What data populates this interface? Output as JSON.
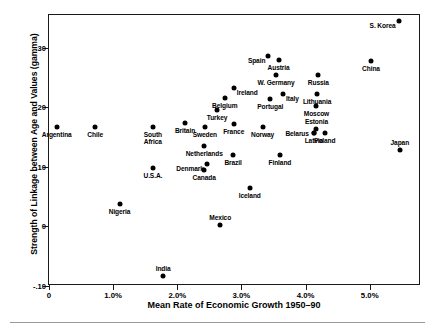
{
  "chart_data": {
    "type": "scatter",
    "title": "",
    "xlabel": "Mean Rate of Economic Growth 1950–90",
    "ylabel": "Strength of Linkage between Age and Values (gamma)",
    "xlim": [
      0,
      5.8
    ],
    "ylim": [
      -0.1,
      0.355
    ],
    "grid": false,
    "legend": "none",
    "xticks": [
      {
        "value": 0,
        "label": "0"
      },
      {
        "value": 1.0,
        "label": "1.0%"
      },
      {
        "value": 2.0,
        "label": "2.0%"
      },
      {
        "value": 3.0,
        "label": "3.0%"
      },
      {
        "value": 4.0,
        "label": "4.0%"
      },
      {
        "value": 5.0,
        "label": "5.0%"
      }
    ],
    "yticks": [
      {
        "value": 0.3,
        "label": ".30"
      },
      {
        "value": 0.2,
        "label": ".20"
      },
      {
        "value": 0.1,
        "label": ".10"
      },
      {
        "value": 0.0,
        "label": "0"
      },
      {
        "value": -0.1,
        "label": "-.10"
      }
    ],
    "points": [
      {
        "name": "S. Korea",
        "x": 5.45,
        "y": 0.345,
        "label_pos": "below-left"
      },
      {
        "name": "China",
        "x": 5.02,
        "y": 0.278,
        "label_pos": "below"
      },
      {
        "name": "Spain",
        "x": 3.42,
        "y": 0.286,
        "label_pos": "below-left"
      },
      {
        "name": "Austria",
        "x": 3.58,
        "y": 0.279,
        "label_pos": "below"
      },
      {
        "name": "W. Germany",
        "x": 3.54,
        "y": 0.255,
        "label_pos": "below"
      },
      {
        "name": "Russia",
        "x": 4.2,
        "y": 0.255,
        "label_pos": "below"
      },
      {
        "name": "Ireland",
        "x": 2.88,
        "y": 0.233,
        "label_pos": "below-right"
      },
      {
        "name": "Belgium",
        "x": 2.74,
        "y": 0.216,
        "label_pos": "below"
      },
      {
        "name": "Lithuania",
        "x": 4.18,
        "y": 0.223,
        "label_pos": "below"
      },
      {
        "name": "Italy",
        "x": 3.65,
        "y": 0.223,
        "label_pos": "below-right"
      },
      {
        "name": "Portugal",
        "x": 3.45,
        "y": 0.214,
        "label_pos": "below"
      },
      {
        "name": "Moscow",
        "x": 4.17,
        "y": 0.203,
        "label_pos": "below"
      },
      {
        "name": "Turkey",
        "x": 2.62,
        "y": 0.196,
        "label_pos": "below"
      },
      {
        "name": "Britain",
        "x": 2.12,
        "y": 0.173,
        "label_pos": "below"
      },
      {
        "name": "France",
        "x": 2.88,
        "y": 0.172,
        "label_pos": "below"
      },
      {
        "name": "Sweden",
        "x": 2.43,
        "y": 0.167,
        "label_pos": "below"
      },
      {
        "name": "Argentina",
        "x": 0.12,
        "y": 0.167,
        "label_pos": "below"
      },
      {
        "name": "Chile",
        "x": 0.72,
        "y": 0.167,
        "label_pos": "below"
      },
      {
        "name": "Norway",
        "x": 3.33,
        "y": 0.167,
        "label_pos": "below"
      },
      {
        "name": "South Africa",
        "x": 1.62,
        "y": 0.167,
        "label_pos": "below"
      },
      {
        "name": "Estonia",
        "x": 4.17,
        "y": 0.163,
        "label_pos": "above"
      },
      {
        "name": "Latvia",
        "x": 4.13,
        "y": 0.157,
        "label_pos": "below"
      },
      {
        "name": "Poland",
        "x": 4.3,
        "y": 0.157,
        "label_pos": "below"
      },
      {
        "name": "Belarus",
        "x": 4.13,
        "y": 0.157,
        "label_pos": "left"
      },
      {
        "name": "Japan",
        "x": 5.47,
        "y": 0.128,
        "label_pos": "above"
      },
      {
        "name": "Netherlands",
        "x": 2.42,
        "y": 0.135,
        "label_pos": "below"
      },
      {
        "name": "Brazil",
        "x": 2.87,
        "y": 0.12,
        "label_pos": "below"
      },
      {
        "name": "Finland",
        "x": 3.6,
        "y": 0.12,
        "label_pos": "below"
      },
      {
        "name": "Denmark",
        "x": 2.46,
        "y": 0.105,
        "label_pos": "below-left"
      },
      {
        "name": "U.S.A.",
        "x": 1.62,
        "y": 0.098,
        "label_pos": "below"
      },
      {
        "name": "Canada",
        "x": 2.42,
        "y": 0.095,
        "label_pos": "below"
      },
      {
        "name": "Iceland",
        "x": 3.13,
        "y": 0.065,
        "label_pos": "below"
      },
      {
        "name": "Nigeria",
        "x": 1.1,
        "y": 0.037,
        "label_pos": "below"
      },
      {
        "name": "Mexico",
        "x": 2.67,
        "y": 0.003,
        "label_pos": "above"
      },
      {
        "name": "India",
        "x": 1.78,
        "y": -0.083,
        "label_pos": "above"
      }
    ]
  }
}
